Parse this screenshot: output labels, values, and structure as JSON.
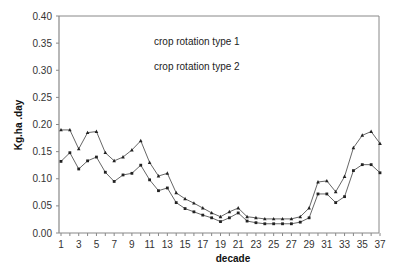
{
  "chart_data": {
    "type": "line",
    "title": "",
    "xlabel": "decade",
    "ylabel": "Kg.ha  .day",
    "ylim": [
      0,
      0.4
    ],
    "xlim": [
      1,
      37
    ],
    "grid": false,
    "legend_position": "top-center (inside plot)",
    "y_ticks": [
      "0.00",
      "0.05",
      "0.10",
      "0.15",
      "0.20",
      "0.25",
      "0.30",
      "0.35",
      "0.40"
    ],
    "x_ticks": [
      "1",
      "3",
      "5",
      "7",
      "9",
      "11",
      "13",
      "15",
      "17",
      "19",
      "21",
      "23",
      "25",
      "27",
      "29",
      "31",
      "33",
      "35",
      "37"
    ],
    "x": [
      1,
      2,
      3,
      4,
      5,
      6,
      7,
      8,
      9,
      10,
      11,
      12,
      13,
      14,
      15,
      16,
      17,
      18,
      19,
      20,
      21,
      22,
      23,
      24,
      25,
      26,
      27,
      28,
      29,
      30,
      31,
      32,
      33,
      34,
      35,
      36,
      37
    ],
    "series": [
      {
        "name": "crop rotation type 1",
        "marker": "triangle",
        "values": [
          0.19,
          0.19,
          0.155,
          0.185,
          0.187,
          0.148,
          0.133,
          0.14,
          0.153,
          0.17,
          0.13,
          0.105,
          0.11,
          0.074,
          0.063,
          0.055,
          0.046,
          0.037,
          0.03,
          0.039,
          0.046,
          0.03,
          0.028,
          0.026,
          0.026,
          0.026,
          0.026,
          0.03,
          0.046,
          0.094,
          0.096,
          0.076,
          0.104,
          0.157,
          0.18,
          0.187,
          0.165
        ]
      },
      {
        "name": "crop rotation type 2",
        "marker": "square",
        "values": [
          0.132,
          0.148,
          0.118,
          0.133,
          0.14,
          0.112,
          0.095,
          0.107,
          0.11,
          0.125,
          0.098,
          0.078,
          0.083,
          0.056,
          0.045,
          0.039,
          0.033,
          0.028,
          0.021,
          0.028,
          0.037,
          0.022,
          0.019,
          0.017,
          0.017,
          0.017,
          0.017,
          0.02,
          0.028,
          0.072,
          0.072,
          0.056,
          0.067,
          0.115,
          0.126,
          0.126,
          0.111
        ]
      }
    ]
  },
  "legend": {
    "items": [
      "crop rotation type 1",
      "crop rotation type 2"
    ]
  },
  "colors": {
    "line": "#555555",
    "marker": "#222222",
    "axis": "#888888"
  }
}
